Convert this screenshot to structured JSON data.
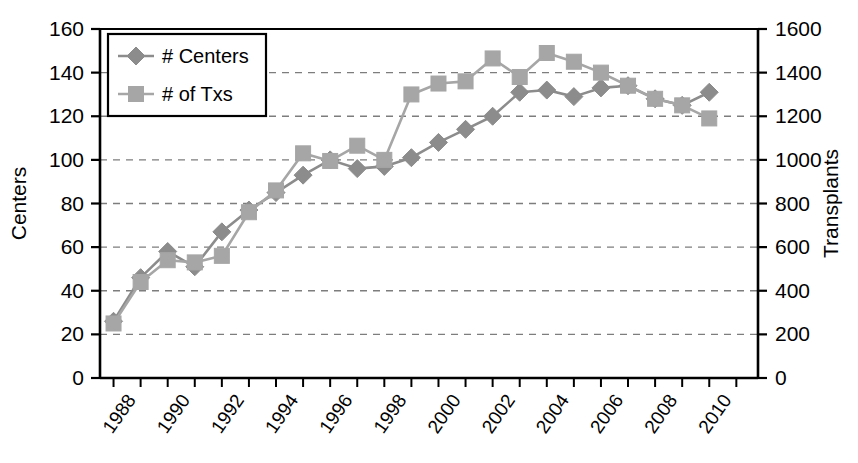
{
  "chart_data": {
    "type": "line",
    "title": "",
    "xlabel": "",
    "ylabel": "Centers",
    "y2label": "Transplants",
    "grid": true,
    "legend_position": "top-left",
    "x": [
      1987,
      1988,
      1989,
      1990,
      1991,
      1992,
      1993,
      1994,
      1995,
      1996,
      1997,
      1998,
      1999,
      2000,
      2001,
      2002,
      2003,
      2004,
      2005,
      2006,
      2007,
      2008,
      2009,
      2010
    ],
    "xtick_labels": [
      "1988",
      "1990",
      "1992",
      "1994",
      "1996",
      "1998",
      "2000",
      "2002",
      "2004",
      "2006",
      "2008",
      "2010"
    ],
    "xtick_values": [
      1988,
      1990,
      1992,
      1994,
      1996,
      1998,
      2000,
      2002,
      2004,
      2006,
      2008,
      2010
    ],
    "xlim": [
      1986.5,
      2010.8
    ],
    "ylim": [
      0,
      160
    ],
    "ytick_values": [
      0,
      20,
      40,
      60,
      80,
      100,
      120,
      140,
      160
    ],
    "ytick_labels": [
      "0",
      "20",
      "40",
      "60",
      "80",
      "100",
      "120",
      "140",
      "160"
    ],
    "y2lim": [
      0,
      1600
    ],
    "y2tick_values": [
      0,
      200,
      400,
      600,
      800,
      1000,
      1200,
      1400,
      1600
    ],
    "y2tick_labels": [
      "0",
      "200",
      "400",
      "600",
      "800",
      "1000",
      "1200",
      "1400",
      "1600"
    ],
    "series": [
      {
        "name": "# Centers",
        "axis": "left",
        "marker": "diamond",
        "color": "#8c8c8c",
        "values": [
          26,
          46,
          58,
          51,
          67,
          77,
          85,
          93,
          100,
          96,
          97,
          101,
          108,
          114,
          120,
          131,
          132,
          129,
          133,
          134,
          128,
          125,
          131,
          null
        ]
      },
      {
        "name": "# of Txs",
        "axis": "right",
        "marker": "square",
        "color": "#a6a6a6",
        "values": [
          250,
          440,
          540,
          530,
          560,
          760,
          860,
          1030,
          995,
          1065,
          1000,
          1300,
          1350,
          1360,
          1465,
          1380,
          1490,
          1450,
          1400,
          1340,
          1280,
          1250,
          1190,
          null
        ]
      }
    ]
  },
  "legend": {
    "items": [
      {
        "label": "# Centers",
        "marker": "diamond",
        "color": "#8c8c8c"
      },
      {
        "label": "# of Txs",
        "marker": "square",
        "color": "#a6a6a6"
      }
    ]
  },
  "axes": {
    "left_title": "Centers",
    "right_title": "Transplants"
  },
  "colors": {
    "axis": "#000000",
    "grid": "#7d7d7d",
    "centers_series": "#8c8c8c",
    "txs_series": "#a6a6a6",
    "background": "#ffffff"
  }
}
